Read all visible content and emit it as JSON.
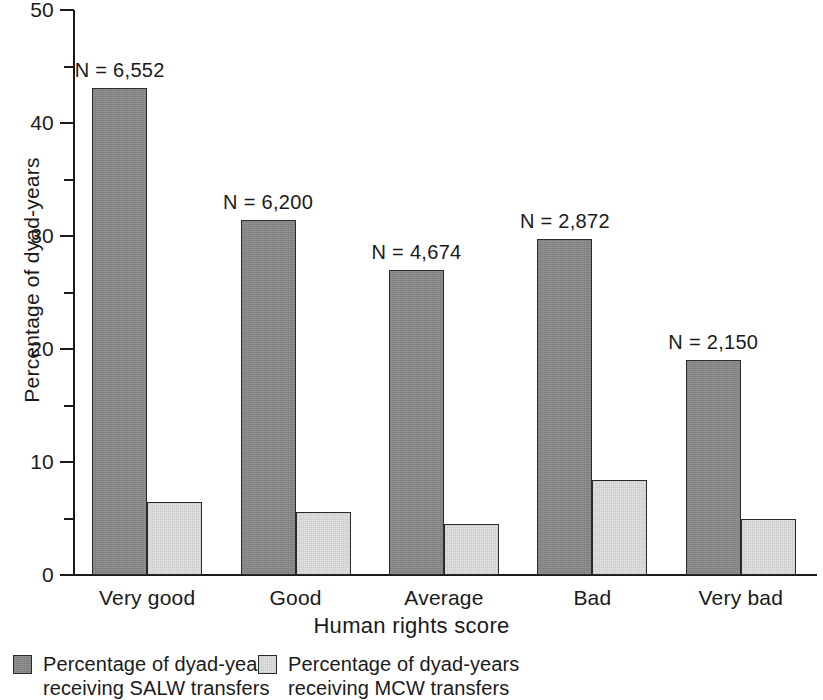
{
  "chart_data": {
    "type": "bar",
    "title": "",
    "xlabel": "Human rights score",
    "ylabel": "Percentage of dyad-years",
    "categories": [
      "Very good",
      "Good",
      "Average",
      "Bad",
      "Very bad"
    ],
    "series": [
      {
        "name": "Percentage of dyad-years receiving SALW transfers",
        "color": "#868686",
        "values": [
          43.1,
          31.4,
          27.0,
          29.7,
          19.0
        ]
      },
      {
        "name": "Percentage of dyad-years receiving MCW transfers",
        "color": "#e2e2e2",
        "values": [
          6.5,
          5.6,
          4.5,
          8.4,
          5.0
        ]
      }
    ],
    "annotations": [
      "N = 6,552",
      "N = 6,200",
      "N = 4,674",
      "N = 2,872",
      "N = 2,150"
    ],
    "ylim": [
      0,
      50
    ],
    "ytick_labels": [
      "0",
      "10",
      "20",
      "30",
      "40",
      "50"
    ],
    "ytick_values": [
      0,
      10,
      20,
      30,
      40,
      50
    ],
    "yminor_values": [
      5,
      15,
      25,
      35,
      45
    ],
    "grid": false,
    "legend_position": "bottom-left"
  },
  "legend": {
    "items": [
      {
        "label": "Percentage of dyad-years\nreceiving SALW transfers",
        "swatch": "dark-gray-swatch"
      },
      {
        "label": "Percentage of dyad-years\nreceiving MCW transfers",
        "swatch": "light-gray-swatch"
      }
    ]
  },
  "axis": {
    "y_title": "Percentage of dyad-years",
    "x_title": "Human rights score"
  }
}
